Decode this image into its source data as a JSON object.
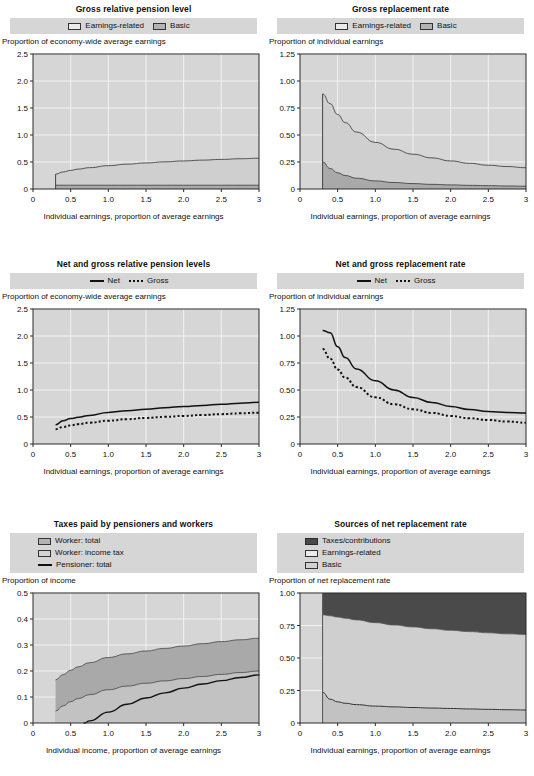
{
  "panels": [
    {
      "id": "gross-relative-pension-level",
      "title": "Gross relative pension level",
      "legend": [
        {
          "label": "Earnings-related",
          "style": "swatch",
          "swatch": "light"
        },
        {
          "label": "Basic",
          "style": "swatch",
          "swatch": "mid"
        }
      ],
      "chart_data": {
        "type": "area",
        "title": "Gross relative pension level",
        "xlabel": "Individual earnings, proportion of average earnings",
        "ylabel": "Proportion of economy-wide average earnings",
        "xlim": [
          0,
          3
        ],
        "ylim": [
          0,
          2.5
        ],
        "xticks": [
          0,
          0.5,
          1.0,
          1.5,
          2.0,
          2.5,
          3
        ],
        "xticklabels": [
          "0",
          "0.5",
          "1.0",
          "1.5",
          "2.0",
          "2.5",
          "3"
        ],
        "yticks": [
          0,
          0.5,
          1.0,
          1.5,
          2.0,
          2.5
        ],
        "yticklabels": [
          "0",
          "0.5",
          "1.0",
          "1.5",
          "2.0",
          "2.5"
        ],
        "grid": true,
        "legend_position": "top",
        "x": [
          0.3,
          0.4,
          0.5,
          0.6,
          0.75,
          1.0,
          1.25,
          1.5,
          1.75,
          2.0,
          2.25,
          2.5,
          2.75,
          3.0
        ],
        "series": [
          {
            "name": "Earnings-related",
            "stacked_total": true,
            "values": [
              0.275,
              0.315,
              0.345,
              0.368,
              0.395,
              0.432,
              0.46,
              0.483,
              0.503,
              0.52,
              0.535,
              0.548,
              0.56,
              0.57
            ]
          },
          {
            "name": "Basic",
            "values": [
              0.07,
              0.07,
              0.07,
              0.07,
              0.07,
              0.07,
              0.07,
              0.07,
              0.07,
              0.07,
              0.07,
              0.07,
              0.07,
              0.07
            ]
          }
        ]
      }
    },
    {
      "id": "gross-replacement-rate",
      "title": "Gross replacement rate",
      "legend": [
        {
          "label": "Earnings-related",
          "style": "swatch",
          "swatch": "light"
        },
        {
          "label": "Basic",
          "style": "swatch",
          "swatch": "mid"
        }
      ],
      "chart_data": {
        "type": "area",
        "title": "Gross replacement rate",
        "xlabel": "Individual earnings, proportion of average earnings",
        "ylabel": "Proportion of individual earnings",
        "xlim": [
          0,
          3
        ],
        "ylim": [
          0,
          1.25
        ],
        "xticks": [
          0,
          0.5,
          1.0,
          1.5,
          2.0,
          2.5,
          3
        ],
        "xticklabels": [
          "0",
          "0.5",
          "1.0",
          "1.5",
          "2.0",
          "2.5",
          "3"
        ],
        "yticks": [
          0,
          0.25,
          0.5,
          0.75,
          1.0,
          1.25
        ],
        "yticklabels": [
          "0",
          "0.25",
          "0.50",
          "0.75",
          "1.00",
          "1.25"
        ],
        "grid": true,
        "legend_position": "top",
        "x": [
          0.3,
          0.4,
          0.5,
          0.6,
          0.75,
          1.0,
          1.25,
          1.5,
          1.75,
          2.0,
          2.25,
          2.5,
          2.75,
          3.0
        ],
        "series": [
          {
            "name": "Earnings-related",
            "stacked_total": true,
            "values": [
              0.88,
              0.79,
              0.69,
              0.615,
              0.527,
              0.432,
              0.368,
              0.322,
              0.288,
              0.26,
              0.238,
              0.22,
              0.208,
              0.197
            ]
          },
          {
            "name": "Basic",
            "values": [
              0.25,
              0.19,
              0.15,
              0.125,
              0.1,
              0.075,
              0.06,
              0.05,
              0.043,
              0.038,
              0.034,
              0.031,
              0.028,
              0.026
            ]
          }
        ]
      }
    },
    {
      "id": "net-and-gross-relative-pension-levels",
      "title": "Net and gross relative pension levels",
      "legend": [
        {
          "label": "Net",
          "style": "line-solid"
        },
        {
          "label": "Gross",
          "style": "line-dotted"
        }
      ],
      "chart_data": {
        "type": "line",
        "title": "Net and gross relative pension levels",
        "xlabel": "Individual earnings, proportion of average earnings",
        "ylabel": "Proportion of economy-wide average earnings",
        "xlim": [
          0,
          3
        ],
        "ylim": [
          0,
          2.5
        ],
        "xticks": [
          0,
          0.5,
          1.0,
          1.5,
          2.0,
          2.5,
          3
        ],
        "xticklabels": [
          "0",
          "0.5",
          "1.0",
          "1.5",
          "2.0",
          "2.5",
          "3"
        ],
        "yticks": [
          0,
          0.5,
          1.0,
          1.5,
          2.0,
          2.5
        ],
        "yticklabels": [
          "0",
          "0.5",
          "1.0",
          "1.5",
          "2.0",
          "2.5"
        ],
        "grid": true,
        "legend_position": "top",
        "x": [
          0.3,
          0.4,
          0.5,
          0.6,
          0.75,
          1.0,
          1.25,
          1.5,
          1.75,
          2.0,
          2.25,
          2.5,
          2.75,
          3.0
        ],
        "series": [
          {
            "name": "Net",
            "dash": "solid",
            "values": [
              0.355,
              0.43,
              0.47,
              0.495,
              0.53,
              0.585,
              0.615,
              0.645,
              0.672,
              0.695,
              0.715,
              0.735,
              0.755,
              0.772
            ]
          },
          {
            "name": "Gross",
            "dash": "dotted",
            "values": [
              0.275,
              0.315,
              0.345,
              0.368,
              0.395,
              0.432,
              0.46,
              0.483,
              0.503,
              0.52,
              0.537,
              0.553,
              0.568,
              0.58
            ]
          }
        ]
      }
    },
    {
      "id": "net-and-gross-replacement-rate",
      "title": "Net and gross replacement rate",
      "legend": [
        {
          "label": "Net",
          "style": "line-solid"
        },
        {
          "label": "Gross",
          "style": "line-dotted"
        }
      ],
      "chart_data": {
        "type": "line",
        "title": "Net and gross replacement rate",
        "xlabel": "Individual earnings, proportion of average earnings",
        "ylabel": "Proportion of individual earnings",
        "xlim": [
          0,
          3
        ],
        "ylim": [
          0,
          1.25
        ],
        "xticks": [
          0,
          0.5,
          1.0,
          1.5,
          2.0,
          2.5,
          3
        ],
        "xticklabels": [
          "0",
          "0.5",
          "1.0",
          "1.5",
          "2.0",
          "2.5",
          "3"
        ],
        "yticks": [
          0,
          0.25,
          0.5,
          0.75,
          1.0,
          1.25
        ],
        "yticklabels": [
          "0",
          "0.25",
          "0.50",
          "0.75",
          "1.00",
          "1.25"
        ],
        "grid": true,
        "legend_position": "top",
        "x": [
          0.3,
          0.4,
          0.5,
          0.6,
          0.75,
          1.0,
          1.25,
          1.5,
          1.75,
          2.0,
          2.25,
          2.5,
          2.75,
          3.0
        ],
        "series": [
          {
            "name": "Net",
            "dash": "solid",
            "values": [
              1.05,
              1.03,
              0.9,
              0.8,
              0.695,
              0.585,
              0.5,
              0.43,
              0.385,
              0.348,
              0.32,
              0.3,
              0.292,
              0.288
            ]
          },
          {
            "name": "Gross",
            "dash": "dotted",
            "values": [
              0.88,
              0.79,
              0.69,
              0.615,
              0.527,
              0.432,
              0.368,
              0.322,
              0.288,
              0.26,
              0.238,
              0.222,
              0.208,
              0.197
            ]
          }
        ]
      }
    },
    {
      "id": "taxes-paid-by-pensioners-and-workers",
      "title": "Taxes paid by pensioners and workers",
      "legend": [
        {
          "label": "Worker: total",
          "style": "swatch",
          "swatch": "mid"
        },
        {
          "label": "Worker: income tax",
          "style": "swatch",
          "swatch": "midlight"
        },
        {
          "label": "Pensioner: total",
          "style": "line-solid"
        }
      ],
      "chart_data": {
        "type": "area",
        "title": "Taxes paid by pensioners and workers",
        "xlabel": "Individual income, proportion of average earnings",
        "ylabel": "Proportion of income",
        "xlim": [
          0,
          3
        ],
        "ylim": [
          0,
          0.5
        ],
        "xticks": [
          0,
          0.5,
          1.0,
          1.5,
          2.0,
          2.5,
          3
        ],
        "xticklabels": [
          "0",
          "0.5",
          "1.0",
          "1.5",
          "2.0",
          "2.5",
          "3"
        ],
        "yticks": [
          0,
          0.1,
          0.2,
          0.3,
          0.4,
          0.5
        ],
        "yticklabels": [
          "0",
          "0.1",
          "0.2",
          "0.3",
          "0.4",
          "0.5"
        ],
        "grid": true,
        "legend_position": "top",
        "x": [
          0.3,
          0.4,
          0.5,
          0.6,
          0.75,
          1.0,
          1.25,
          1.5,
          1.75,
          2.0,
          2.25,
          2.5,
          2.75,
          3.0
        ],
        "series": [
          {
            "name": "Worker: total",
            "values": [
              0.166,
              0.186,
              0.203,
              0.216,
              0.232,
              0.252,
              0.266,
              0.277,
              0.287,
              0.296,
              0.305,
              0.313,
              0.32,
              0.326
            ]
          },
          {
            "name": "Worker: income tax",
            "values": [
              0.046,
              0.066,
              0.082,
              0.094,
              0.109,
              0.128,
              0.142,
              0.153,
              0.162,
              0.171,
              0.179,
              0.187,
              0.194,
              0.2
            ]
          },
          {
            "name": "Pensioner: total",
            "dash": "solid",
            "starts_at_x": 0.68,
            "values": [
              0.0,
              0.0,
              0.0,
              0.0,
              0.008,
              0.042,
              0.072,
              0.096,
              0.116,
              0.134,
              0.15,
              0.163,
              0.175,
              0.185
            ]
          }
        ]
      }
    },
    {
      "id": "sources-of-net-replacement-rate",
      "title": "Sources of net replacement rate",
      "legend": [
        {
          "label": "Taxes/contributions",
          "style": "swatch",
          "swatch": "dark"
        },
        {
          "label": "Earnings-related",
          "style": "swatch",
          "swatch": "light"
        },
        {
          "label": "Basic",
          "style": "swatch",
          "swatch": "midlight"
        }
      ],
      "chart_data": {
        "type": "area",
        "title": "Sources of net replacement rate",
        "xlabel": "Individual earnings, proportion of average earnings",
        "ylabel": "Proportion of net replacement rate",
        "xlim": [
          0,
          3
        ],
        "ylim": [
          0,
          1.0
        ],
        "xticks": [
          0,
          0.5,
          1.0,
          1.5,
          2.0,
          2.5,
          3
        ],
        "xticklabels": [
          "0",
          "0.5",
          "1.0",
          "1.5",
          "2.0",
          "2.5",
          "3"
        ],
        "yticks": [
          0,
          0.25,
          0.5,
          0.75,
          1.0
        ],
        "yticklabels": [
          "0",
          "0.25",
          "0.50",
          "0.75",
          "1.00"
        ],
        "grid": true,
        "legend_position": "top",
        "x": [
          0.3,
          0.4,
          0.5,
          0.6,
          0.75,
          1.0,
          1.25,
          1.5,
          1.75,
          2.0,
          2.25,
          2.5,
          2.75,
          3.0
        ],
        "series": [
          {
            "name": "Basic",
            "values": [
              0.235,
              0.183,
              0.163,
              0.152,
              0.141,
              0.13,
              0.124,
              0.119,
              0.115,
              0.112,
              0.108,
              0.105,
              0.102,
              0.1
            ]
          },
          {
            "name": "Earnings-related",
            "cumulative_top": true,
            "values": [
              0.832,
              0.825,
              0.815,
              0.806,
              0.793,
              0.772,
              0.754,
              0.739,
              0.725,
              0.713,
              0.703,
              0.694,
              0.686,
              0.681
            ]
          },
          {
            "name": "Taxes/contributions",
            "cumulative_top": true,
            "values": [
              1.0,
              1.0,
              1.0,
              1.0,
              1.0,
              1.0,
              1.0,
              1.0,
              1.0,
              1.0,
              1.0,
              1.0,
              1.0,
              1.0
            ]
          }
        ]
      }
    }
  ],
  "colors": {
    "plot_background": "#d6d6d6",
    "grid": "#f2f2f2",
    "axis": "#2b2b2b",
    "area_light": "#cfcfcf",
    "area_mid": "#a9a9a9",
    "area_midlight": "#c2c2c2",
    "area_dark": "#4a4a4a",
    "line": "#111111",
    "legend_background": "#d6d6d6"
  }
}
